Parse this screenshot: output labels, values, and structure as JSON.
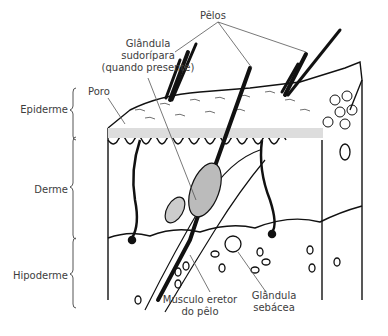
{
  "diagram": {
    "type": "anatomical-illustration",
    "labels": {
      "pelos": "Pêlos",
      "glandula_sudoripara_1": "Glândula",
      "glandula_sudoripara_2": "sudorípara",
      "glandula_sudoripara_3": "(quando presente)",
      "poro": "Poro",
      "epiderme": "Epiderme",
      "derme": "Derme",
      "hipoderme": "Hipoderme",
      "musculo_1": "Músculo eretor",
      "musculo_2": "do pêlo",
      "glandula_sebacea_1": "Glândula",
      "glandula_sebacea_2": "sebácea"
    },
    "layers": [
      "Epiderme",
      "Derme",
      "Hipoderme"
    ]
  }
}
